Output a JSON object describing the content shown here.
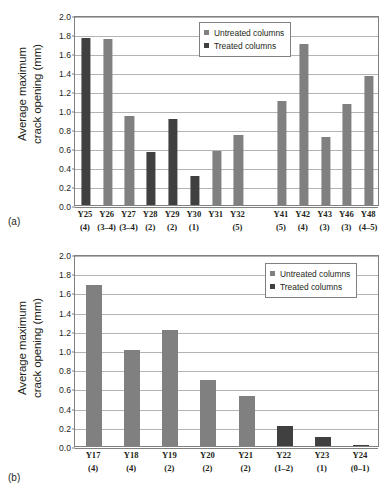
{
  "figure": {
    "panels": [
      {
        "tag": "(a)",
        "ylabel_line1": "Average maximum",
        "ylabel_line2": "crack opening (mm)"
      },
      {
        "tag": "(b)",
        "ylabel_line1": "Average maximum",
        "ylabel_line2": "crack opening (mm)"
      }
    ]
  },
  "legend": {
    "untreated_label": "Untreated columns",
    "treated_label": "Treated columns",
    "untreated_color": "#808080",
    "treated_color": "#404040"
  },
  "chart_data": [
    {
      "type": "bar",
      "panel": "(a)",
      "title": "",
      "xlabel": "",
      "ylabel": "Average maximum crack opening (mm)",
      "ylim": [
        0,
        2.0
      ],
      "ytick_labels": [
        "0.0",
        "0.2",
        "0.4",
        "0.6",
        "0.8",
        "1.0",
        "1.2",
        "1.4",
        "1.6",
        "1.8",
        "2.0"
      ],
      "ytick_values": [
        0.0,
        0.2,
        0.4,
        0.6,
        0.8,
        1.0,
        1.2,
        1.4,
        1.6,
        1.8,
        2.0
      ],
      "grid": true,
      "legend_position": "top-center",
      "categories": [
        "Y25",
        "Y26",
        "Y27",
        "Y28",
        "Y29",
        "Y30",
        "Y31",
        "Y32",
        "",
        "Y41",
        "Y42",
        "Y43",
        "Y46",
        "Y48"
      ],
      "sublabels": [
        "(4)",
        "(3–4)",
        "(3–4)",
        "(2)",
        "(2)",
        "(1)",
        "",
        "(5)",
        "",
        "(5)",
        "(4)",
        "(3)",
        "(3)",
        "(4–5)"
      ],
      "values": [
        1.76,
        1.75,
        0.94,
        0.56,
        0.91,
        0.31,
        0.57,
        0.74,
        null,
        1.1,
        1.7,
        0.72,
        1.06,
        1.36
      ],
      "treatment": [
        "treated",
        "untreated",
        "untreated",
        "treated",
        "treated",
        "treated",
        "untreated",
        "untreated",
        null,
        "untreated",
        "untreated",
        "untreated",
        "untreated",
        "untreated"
      ]
    },
    {
      "type": "bar",
      "panel": "(b)",
      "title": "",
      "xlabel": "",
      "ylabel": "Average maximum crack opening (mm)",
      "ylim": [
        0,
        2.0
      ],
      "ytick_labels": [
        "0.0",
        "0.2",
        "0.4",
        "0.6",
        "0.8",
        "1.0",
        "1.2",
        "1.4",
        "1.6",
        "1.8",
        "2.0"
      ],
      "ytick_values": [
        0.0,
        0.2,
        0.4,
        0.6,
        0.8,
        1.0,
        1.2,
        1.4,
        1.6,
        1.8,
        2.0
      ],
      "grid": true,
      "legend_position": "top-right",
      "categories": [
        "Y17",
        "Y18",
        "Y19",
        "Y20",
        "Y21",
        "Y22",
        "Y23",
        "Y24"
      ],
      "sublabels": [
        "(4)",
        "(4)",
        "(2)",
        "(2)",
        "(2)",
        "(1–2)",
        "(1)",
        "(0–1)"
      ],
      "values": [
        1.68,
        1.0,
        1.21,
        0.69,
        0.52,
        0.21,
        0.09,
        0.01
      ],
      "treatment": [
        "untreated",
        "untreated",
        "untreated",
        "untreated",
        "untreated",
        "treated",
        "treated",
        "treated"
      ]
    }
  ]
}
